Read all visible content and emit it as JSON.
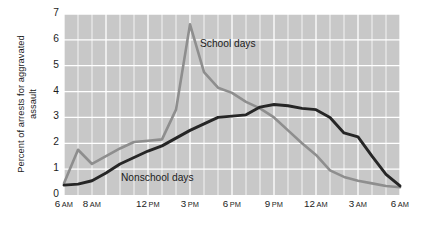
{
  "chart_data": {
    "type": "line",
    "title": "",
    "xlabel": "",
    "ylabel": "Percent of arrests for aggravated assault",
    "ylim": [
      0,
      7
    ],
    "yticks": [
      0,
      1,
      2,
      3,
      4,
      5,
      6,
      7
    ],
    "ytick_labels": [
      "0",
      "1",
      "2",
      "3",
      "4",
      "5",
      "6",
      "7"
    ],
    "xlim": [
      6,
      30
    ],
    "grid": true,
    "grid_color": "#ffffff",
    "plot_background": "#c8c8c8",
    "legend_position": "inline-annotations",
    "xtick_positions": [
      6,
      8,
      12,
      15,
      18,
      21,
      24,
      27,
      30
    ],
    "xtick_labels": [
      {
        "hour": "6",
        "meridiem": "AM"
      },
      {
        "hour": "8",
        "meridiem": "AM"
      },
      {
        "hour": "12",
        "meridiem": "PM"
      },
      {
        "hour": "3",
        "meridiem": "PM"
      },
      {
        "hour": "6",
        "meridiem": "PM"
      },
      {
        "hour": "9",
        "meridiem": "PM"
      },
      {
        "hour": "12",
        "meridiem": "AM"
      },
      {
        "hour": "3",
        "meridiem": "AM"
      },
      {
        "hour": "6",
        "meridiem": "AM"
      }
    ],
    "x": [
      6,
      7,
      8,
      9,
      10,
      11,
      12,
      13,
      14,
      15,
      16,
      17,
      18,
      19,
      20,
      21,
      22,
      23,
      24,
      25,
      26,
      27,
      28,
      29,
      30
    ],
    "series": [
      {
        "name": "School days",
        "color": "#8e8e8e",
        "label_text": "School days",
        "values": [
          0.45,
          1.75,
          1.2,
          1.5,
          1.8,
          2.05,
          2.1,
          2.15,
          3.3,
          6.6,
          4.75,
          4.15,
          3.95,
          3.6,
          3.35,
          3.0,
          2.5,
          2.0,
          1.55,
          0.95,
          0.7,
          0.55,
          0.45,
          0.35,
          0.3
        ]
      },
      {
        "name": "Nonschool days",
        "color": "#262626",
        "label_text": "Nonschool days",
        "values": [
          0.38,
          0.42,
          0.55,
          0.85,
          1.2,
          1.45,
          1.7,
          1.9,
          2.2,
          2.5,
          2.75,
          3.0,
          3.05,
          3.1,
          3.4,
          3.5,
          3.45,
          3.35,
          3.3,
          3.0,
          2.4,
          2.25,
          1.5,
          0.8,
          0.35
        ]
      }
    ]
  }
}
